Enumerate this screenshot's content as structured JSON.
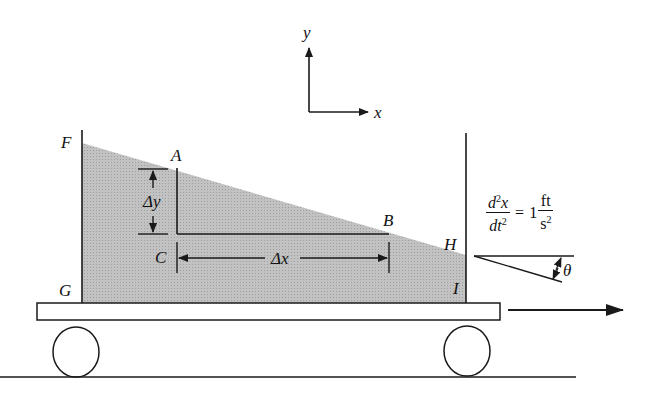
{
  "figure": {
    "type": "physics-diagram"
  },
  "axes": {
    "x_label": "x",
    "y_label": "y"
  },
  "points": {
    "F": "F",
    "A": "A",
    "B": "B",
    "C": "C",
    "G": "G",
    "H": "H",
    "I": "I"
  },
  "dimensions": {
    "delta_y": "Δy",
    "delta_x": "Δx"
  },
  "acceleration": {
    "lhs_num": "d",
    "lhs_num_sup": "2",
    "lhs_num_var": "x",
    "lhs_den": "dt",
    "lhs_den_sup": "2",
    "equals": "=",
    "value": "1",
    "unit_num": "ft",
    "unit_den": "s",
    "unit_den_sup": "2"
  },
  "angle_label": "θ",
  "colors": {
    "liquid": "#bdbdbd",
    "line": "#1a1a1a",
    "background": "#ffffff"
  }
}
